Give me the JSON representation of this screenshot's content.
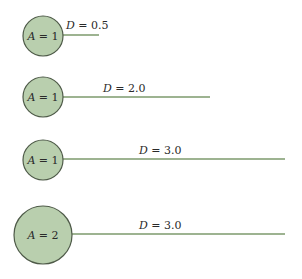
{
  "colors": {
    "circle_fill": "#b9cfae",
    "circle_stroke": "#4e5a48",
    "line": "#7c9a6c",
    "text": "#2a2a2a"
  },
  "rows": [
    {
      "area_label": "A = 1",
      "area_var": "A",
      "area_value": "1",
      "distance_label": "D = 0.5",
      "distance_var": "D",
      "distance_value": "0.5",
      "cx": 43,
      "cy": 36,
      "r": 20,
      "line_end_x": 99,
      "line_y": 35,
      "label_x": 66,
      "label_y": 29
    },
    {
      "area_label": "A = 1",
      "area_var": "A",
      "area_value": "1",
      "distance_label": "D = 2.0",
      "distance_var": "D",
      "distance_value": "2.0",
      "cx": 43,
      "cy": 97,
      "r": 20,
      "line_end_x": 210,
      "line_y": 97,
      "label_x": 103,
      "label_y": 92
    },
    {
      "area_label": "A = 1",
      "area_var": "A",
      "area_value": "1",
      "distance_label": "D = 3.0",
      "distance_var": "D",
      "distance_value": "3.0",
      "cx": 43,
      "cy": 160,
      "r": 20,
      "line_end_x": 285,
      "line_y": 159,
      "label_x": 139,
      "label_y": 154
    },
    {
      "area_label": "A = 2",
      "area_var": "A",
      "area_value": "2",
      "distance_label": "D = 3.0",
      "distance_var": "D",
      "distance_value": "3.0",
      "cx": 43,
      "cy": 235,
      "r": 29,
      "line_end_x": 285,
      "line_y": 234,
      "label_x": 139,
      "label_y": 229
    }
  ]
}
